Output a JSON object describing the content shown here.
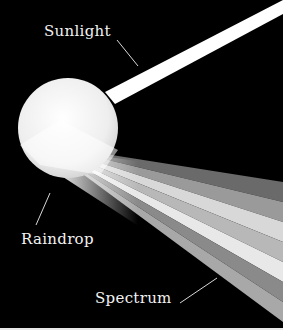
{
  "diagram": {
    "labels": {
      "sunlight": "Sunlight",
      "raindrop": "Raindrop",
      "spectrum": "Spectrum"
    },
    "colors": {
      "background": "#000000",
      "beam": "#ffffff",
      "drop": "#f4f4f4",
      "label_text": "#f2f2f2",
      "leader_line": "#d8d8d8"
    },
    "spectrum_bands": [
      "#6a6a6a",
      "#9a9a9a",
      "#d8d8d8",
      "#b8b8b8",
      "#e8e8e8",
      "#8a8a8a",
      "#a8a8a8"
    ]
  }
}
